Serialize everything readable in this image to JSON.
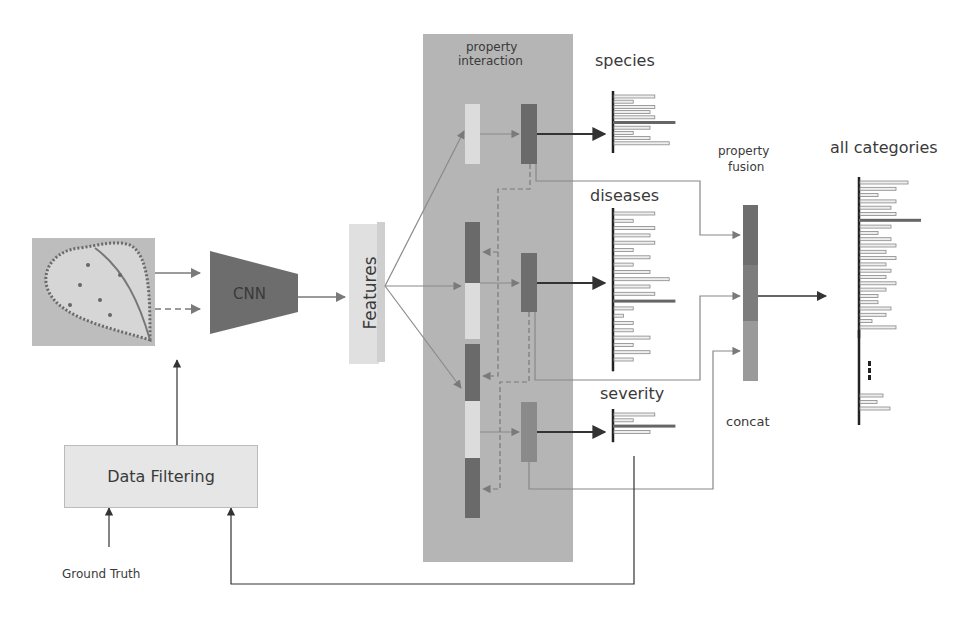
{
  "diagram": {
    "input_image": {
      "description": "diseased leaf photo"
    },
    "cnn": {
      "label": "CNN"
    },
    "features": {
      "label": "Features"
    },
    "data_filtering": {
      "label": "Data Filtering"
    },
    "ground_truth": {
      "label": "Ground Truth"
    },
    "property_interaction": {
      "label_line1": "property",
      "label_line2": "interaction"
    },
    "branches": [
      {
        "label": "species",
        "bar_lengths": [
          34,
          16,
          34,
          30,
          34,
          52,
          30,
          16,
          30,
          46
        ],
        "highlight_index": 5
      },
      {
        "label": "diseases",
        "bar_lengths": [
          34,
          16,
          34,
          30,
          34,
          16,
          30,
          16,
          30,
          46,
          30,
          34,
          52,
          16,
          8,
          16,
          16,
          30,
          16,
          30,
          16
        ],
        "highlight_index": 12
      },
      {
        "label": "severity",
        "bar_lengths": [
          34,
          16,
          52,
          30
        ],
        "highlight_index": 2
      }
    ],
    "property_fusion": {
      "label_line1": "property",
      "label_line2": "fusion",
      "concat_label": "concat"
    },
    "all_categories": {
      "label": "all categories",
      "bar_lengths": [
        48,
        36,
        18,
        36,
        31,
        36,
        62,
        31,
        18,
        31,
        36,
        26,
        36,
        26,
        31,
        26,
        36,
        26,
        18,
        18,
        31,
        26,
        12,
        36
      ],
      "highlight_index": 6,
      "tail_bar_lengths": [
        23,
        17,
        30
      ],
      "ellipsis": "⋮"
    },
    "colors": {
      "panel": "#b5b5b5",
      "dark_block": "#6a6a6a",
      "light_block": "#dcdcdc",
      "severity_block": "#8a8a8a",
      "fusion_top": "#6e6e6e",
      "fusion_mid": "#7d7d7d",
      "fusion_bot": "#9a9a9a",
      "arrow": "#7a7a7a",
      "dark_arrow": "#333333",
      "cnn": "#6d6d6d"
    }
  }
}
